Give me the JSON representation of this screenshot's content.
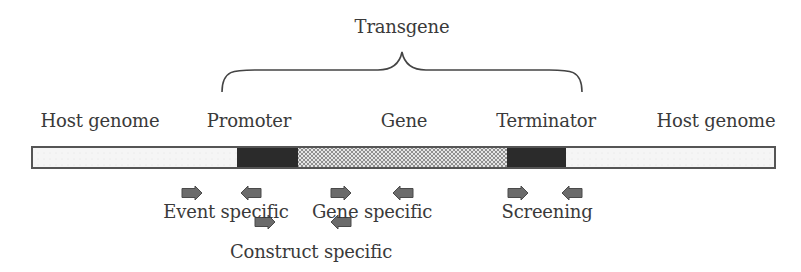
{
  "diagram": {
    "title": "Transgene",
    "regions": [
      {
        "id": "host-left",
        "label": "Host genome",
        "x0": 32,
        "x1": 237,
        "fill": "#f4f4f4",
        "pattern": "light"
      },
      {
        "id": "promoter",
        "label": "Promoter",
        "x0": 237,
        "x1": 298,
        "fill": "#2b2b2b",
        "pattern": "solid"
      },
      {
        "id": "gene",
        "label": "Gene",
        "x0": 298,
        "x1": 507,
        "fill": "#cfcfcf",
        "pattern": "stipple"
      },
      {
        "id": "terminator",
        "label": "Terminator",
        "x0": 507,
        "x1": 566,
        "fill": "#2b2b2b",
        "pattern": "solid"
      },
      {
        "id": "host-right",
        "label": "Host genome",
        "x0": 566,
        "x1": 775,
        "fill": "#f4f4f4",
        "pattern": "light"
      }
    ],
    "bar": {
      "y": 147,
      "height": 21,
      "stroke": "#555555"
    },
    "brace": {
      "x0": 222,
      "x1": 582,
      "y_bottom": 92,
      "y_mid": 70,
      "peak_x": 402,
      "peak_y": 52
    },
    "region_labels": [
      {
        "text": "Host genome",
        "x": 100,
        "y": 112
      },
      {
        "text": "Promoter",
        "x": 249,
        "y": 112
      },
      {
        "text": "Gene",
        "x": 404,
        "y": 112
      },
      {
        "text": "Terminator",
        "x": 546,
        "y": 112
      },
      {
        "text": "Host genome",
        "x": 716,
        "y": 112
      }
    ],
    "title_pos": {
      "x": 402,
      "y": 18
    },
    "primer_color": "#6b6b6b",
    "primer_sets": [
      {
        "label": "Event specific",
        "label_x": 226,
        "label_y": 203,
        "forward": {
          "x": 192,
          "y": 193
        },
        "reverse": {
          "x": 251,
          "y": 193
        }
      },
      {
        "label": "Construct specific",
        "label_x": 311,
        "label_y": 243,
        "forward": {
          "x": 265,
          "y": 222
        },
        "reverse": {
          "x": 341,
          "y": 222
        }
      },
      {
        "label": "Gene specific",
        "label_x": 372,
        "label_y": 203,
        "forward": {
          "x": 341,
          "y": 193
        },
        "reverse": {
          "x": 403,
          "y": 193
        }
      },
      {
        "label": "Screening",
        "label_x": 547,
        "label_y": 203,
        "forward": {
          "x": 518,
          "y": 193
        },
        "reverse": {
          "x": 572,
          "y": 193
        }
      }
    ]
  }
}
